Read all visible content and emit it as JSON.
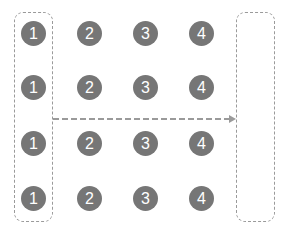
{
  "diagram": {
    "colors": {
      "node_fill": "#767676",
      "node_text": "#ffffff",
      "dashed_line": "#9a9a9a"
    },
    "rows": [
      {
        "cells": [
          "1",
          "2",
          "3",
          "4"
        ]
      },
      {
        "cells": [
          "1",
          "2",
          "3",
          "4"
        ]
      },
      {
        "cells": [
          "1",
          "2",
          "3",
          "4"
        ]
      },
      {
        "cells": [
          "1",
          "2",
          "3",
          "4"
        ]
      }
    ],
    "source_box_label": "column 1 selection",
    "target_box_label": "empty target container",
    "arrow": "dashed-arrow-right"
  }
}
